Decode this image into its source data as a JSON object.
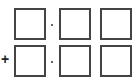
{
  "problem": {
    "operator": "+",
    "separator": "·",
    "rows": [
      {
        "boxes": [
          "",
          "",
          ""
        ]
      },
      {
        "boxes": [
          "",
          "",
          ""
        ]
      }
    ]
  },
  "colors": {
    "border": "#444444",
    "background": "#ffffff"
  }
}
